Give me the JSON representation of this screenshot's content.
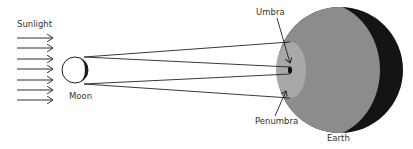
{
  "diagram": {
    "labels": {
      "sunlight": "Sunlight",
      "moon": "Moon",
      "umbra": "Umbra",
      "penumbra": "Penumbra",
      "earth": "Earth"
    },
    "colors": {
      "earth_lit": "#8c8c8c",
      "earth_night": "#141414",
      "penumbra": "#a8a8a8",
      "umbra": "#000000",
      "lines": "#222222",
      "moon_fill": "#ffffff",
      "moon_dark": "#1a1a1a"
    },
    "sunlight_arrows": 7
  }
}
